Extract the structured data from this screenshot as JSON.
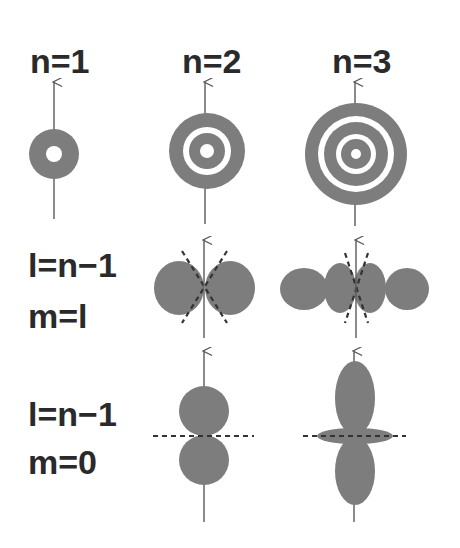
{
  "figure": {
    "columns": [
      {
        "label": "n=1",
        "n": 1
      },
      {
        "label": "n=2",
        "n": 2
      },
      {
        "label": "n=3",
        "n": 3
      }
    ],
    "rows": [
      {
        "id": "radial",
        "label_lines": []
      },
      {
        "id": "m-equals-l",
        "label_lines": [
          "l=n−1",
          "m=l"
        ]
      },
      {
        "id": "m-equals-0",
        "label_lines": [
          "l=n−1",
          "m=0"
        ]
      }
    ],
    "row_labels": {
      "row2_line1": "l=n−1",
      "row2_line2": "m=l",
      "row3_line1": "l=n−1",
      "row3_line2": "m=0"
    },
    "colors": {
      "lobe_fill": "#7d7d7d",
      "axis": "#5a5a5a",
      "nodal_line": "#333333",
      "text": "#2a2a2a",
      "background": "#ffffff"
    },
    "panels": [
      {
        "row": "radial",
        "n": 1,
        "shape": "disc",
        "rings": 1,
        "description": "filled disc with central hole"
      },
      {
        "row": "radial",
        "n": 2,
        "shape": "disc",
        "rings": 2,
        "description": "disc with one white nodal ring and central hole"
      },
      {
        "row": "radial",
        "n": 3,
        "shape": "disc",
        "rings": 3,
        "description": "disc with two white nodal rings and central hole"
      },
      {
        "row": "m-equals-l",
        "n": 2,
        "shape": "two lobes",
        "nodal_cones": 1
      },
      {
        "row": "m-equals-l",
        "n": 3,
        "shape": "four lobes",
        "nodal_cones": 1
      },
      {
        "row": "m-equals-0",
        "n": 2,
        "shape": "two vertical lobes",
        "nodal_plane": "horizontal"
      },
      {
        "row": "m-equals-0",
        "n": 3,
        "shape": "two elongated lobes with equatorial torus",
        "nodal_plane": "horizontal"
      }
    ]
  }
}
